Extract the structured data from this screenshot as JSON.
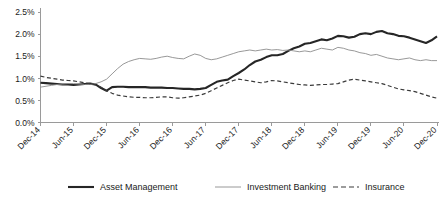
{
  "chart_data": {
    "type": "line",
    "title": "",
    "subtitle": "",
    "xlabel": "",
    "ylabel": "",
    "grid": false,
    "legend_position": "bottom",
    "ylim": [
      0.0,
      2.5
    ],
    "ytick_labels": [
      "0.0%",
      "0.5%",
      "1.0%",
      "1.5%",
      "2.0%",
      "2.5%"
    ],
    "ytick_values": [
      0.0,
      0.5,
      1.0,
      1.5,
      2.0,
      2.5
    ],
    "xtick_labels": [
      "Dec-14",
      "Jun-15",
      "Dec-15",
      "Jun-16",
      "Dec-16",
      "Jun-17",
      "Dec-17",
      "Jun-18",
      "Dec-18",
      "Jun-19",
      "Dec-19",
      "Jun-20",
      "Dec-20"
    ],
    "x": [
      "Dec-14",
      "Jan-15",
      "Feb-15",
      "Mar-15",
      "Apr-15",
      "May-15",
      "Jun-15",
      "Jul-15",
      "Aug-15",
      "Sep-15",
      "Oct-15",
      "Nov-15",
      "Dec-15",
      "Jan-16",
      "Feb-16",
      "Mar-16",
      "Apr-16",
      "May-16",
      "Jun-16",
      "Jul-16",
      "Aug-16",
      "Sep-16",
      "Oct-16",
      "Nov-16",
      "Dec-16",
      "Jan-17",
      "Feb-17",
      "Mar-17",
      "Apr-17",
      "May-17",
      "Jun-17",
      "Jul-17",
      "Aug-17",
      "Sep-17",
      "Oct-17",
      "Nov-17",
      "Dec-17",
      "Jan-18",
      "Feb-18",
      "Mar-18",
      "Apr-18",
      "May-18",
      "Jun-18",
      "Jul-18",
      "Aug-18",
      "Sep-18",
      "Oct-18",
      "Nov-18",
      "Dec-18",
      "Jan-19",
      "Feb-19",
      "Mar-19",
      "Apr-19",
      "May-19",
      "Jun-19",
      "Jul-19",
      "Aug-19",
      "Sep-19",
      "Oct-19",
      "Nov-19",
      "Dec-19",
      "Jan-20",
      "Feb-20",
      "Mar-20",
      "Apr-20",
      "May-20",
      "Jun-20",
      "Jul-20",
      "Aug-20",
      "Sep-20",
      "Oct-20",
      "Nov-20",
      "Dec-20"
    ],
    "series": [
      {
        "name": "Asset Management",
        "style": "solid-thick",
        "color": "#262626",
        "values": [
          0.9,
          0.89,
          0.88,
          0.87,
          0.86,
          0.86,
          0.85,
          0.86,
          0.87,
          0.88,
          0.86,
          0.78,
          0.72,
          0.8,
          0.81,
          0.81,
          0.8,
          0.8,
          0.8,
          0.8,
          0.79,
          0.79,
          0.79,
          0.78,
          0.78,
          0.77,
          0.76,
          0.76,
          0.75,
          0.76,
          0.78,
          0.85,
          0.92,
          0.95,
          0.97,
          1.05,
          1.12,
          1.2,
          1.3,
          1.38,
          1.42,
          1.48,
          1.52,
          1.52,
          1.55,
          1.62,
          1.68,
          1.72,
          1.78,
          1.8,
          1.84,
          1.88,
          1.86,
          1.9,
          1.96,
          1.95,
          1.92,
          1.94,
          2.0,
          2.02,
          2.0,
          2.05,
          2.07,
          2.02,
          2.0,
          1.96,
          1.95,
          1.92,
          1.88,
          1.84,
          1.8,
          1.86,
          1.95
        ]
      },
      {
        "name": "Investment Banking",
        "style": "solid-thin",
        "color": "#8c8c8c",
        "values": [
          0.8,
          0.82,
          0.84,
          0.86,
          0.87,
          0.88,
          0.88,
          0.87,
          0.86,
          0.86,
          0.88,
          0.92,
          0.98,
          1.1,
          1.22,
          1.32,
          1.38,
          1.42,
          1.45,
          1.44,
          1.43,
          1.45,
          1.48,
          1.5,
          1.47,
          1.45,
          1.44,
          1.5,
          1.55,
          1.52,
          1.45,
          1.42,
          1.44,
          1.48,
          1.52,
          1.56,
          1.6,
          1.62,
          1.64,
          1.62,
          1.64,
          1.66,
          1.64,
          1.65,
          1.63,
          1.64,
          1.62,
          1.6,
          1.62,
          1.6,
          1.64,
          1.68,
          1.66,
          1.64,
          1.7,
          1.68,
          1.64,
          1.62,
          1.58,
          1.56,
          1.52,
          1.54,
          1.5,
          1.46,
          1.44,
          1.42,
          1.44,
          1.46,
          1.42,
          1.4,
          1.42,
          1.4,
          1.4
        ]
      },
      {
        "name": "Insurance",
        "style": "dashed",
        "color": "#3a3a3a",
        "values": [
          1.05,
          1.02,
          1.0,
          0.98,
          0.96,
          0.95,
          0.94,
          0.92,
          0.9,
          0.88,
          0.85,
          0.8,
          0.72,
          0.66,
          0.62,
          0.6,
          0.58,
          0.57,
          0.57,
          0.56,
          0.56,
          0.57,
          0.58,
          0.58,
          0.56,
          0.55,
          0.56,
          0.58,
          0.6,
          0.62,
          0.66,
          0.72,
          0.78,
          0.84,
          0.9,
          0.95,
          0.98,
          0.96,
          0.94,
          0.92,
          0.9,
          0.92,
          0.95,
          0.94,
          0.92,
          0.9,
          0.88,
          0.86,
          0.85,
          0.84,
          0.85,
          0.86,
          0.86,
          0.87,
          0.88,
          0.92,
          0.96,
          0.98,
          0.96,
          0.94,
          0.92,
          0.9,
          0.88,
          0.84,
          0.8,
          0.76,
          0.74,
          0.72,
          0.7,
          0.66,
          0.62,
          0.58,
          0.55
        ]
      }
    ]
  },
  "legend": {
    "items": [
      {
        "label": "Asset Management"
      },
      {
        "label": "Investment Banking"
      },
      {
        "label": "Insurance"
      }
    ]
  }
}
